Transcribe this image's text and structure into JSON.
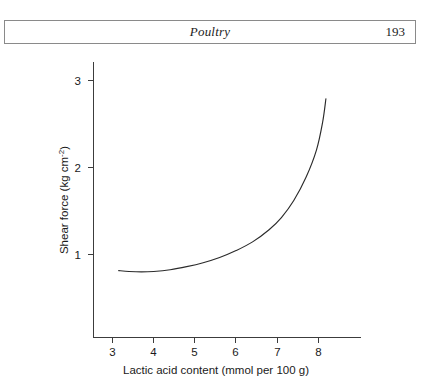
{
  "page_header": {
    "title": "Poultry",
    "folio": "193"
  },
  "chart_data": {
    "type": "line",
    "title": "",
    "xlabel": "Lactic acid content (mmol per 100 g)",
    "ylabel": "Shear force (kg cm",
    "ylabel_sup": "-2",
    "ylabel_suffix": ")",
    "xlim": [
      2.55,
      8.55
    ],
    "ylim": [
      0.45,
      3.25
    ],
    "xticks": [
      3,
      4,
      5,
      6,
      7,
      8
    ],
    "xtick_labels": [
      "3",
      "4",
      "5",
      "6",
      "7",
      "8"
    ],
    "yticks": [
      1,
      2,
      3
    ],
    "ytick_labels": [
      "1",
      "2",
      "3"
    ],
    "grid": false,
    "legend": "none",
    "series": [
      {
        "name": "shear force vs lactic acid",
        "x": [
          3.15,
          3.4,
          3.7,
          4.0,
          4.4,
          4.8,
          5.2,
          5.6,
          6.0,
          6.4,
          6.8,
          7.1,
          7.4,
          7.7,
          7.95,
          8.1,
          8.18
        ],
        "y": [
          0.815,
          0.805,
          0.8,
          0.805,
          0.825,
          0.86,
          0.905,
          0.965,
          1.045,
          1.145,
          1.285,
          1.425,
          1.62,
          1.89,
          2.2,
          2.52,
          2.79
        ]
      }
    ]
  }
}
